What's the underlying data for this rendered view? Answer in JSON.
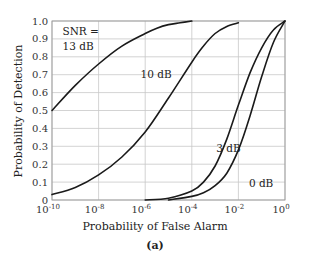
{
  "chart_data": {
    "type": "line",
    "title": "",
    "caption": "(a)",
    "xlabel": "Probability of False Alarm",
    "ylabel": "Probability of Detection",
    "xscale": "log",
    "xlim": [
      1e-10,
      1
    ],
    "ylim": [
      0,
      1.0
    ],
    "grid": true,
    "x_ticks": [
      {
        "base": "10",
        "exp": "-10",
        "log": -10
      },
      {
        "base": "10",
        "exp": "-8",
        "log": -8
      },
      {
        "base": "10",
        "exp": "-6",
        "log": -6
      },
      {
        "base": "10",
        "exp": "-4",
        "log": -4
      },
      {
        "base": "10",
        "exp": "-2",
        "log": -2
      },
      {
        "base": "10",
        "exp": "0",
        "log": 0
      }
    ],
    "y_ticks": [
      "0",
      "0.1",
      "0.2",
      "0.3",
      "0.4",
      "0.5",
      "0.6",
      "0.7",
      "0.8",
      "0.9",
      "1.0"
    ],
    "series": [
      {
        "name": "SNR = 13 dB",
        "label_lines": [
          "SNR =",
          "13 dB"
        ],
        "log_x": [
          -10,
          -9,
          -8,
          -7,
          -6,
          -5.5,
          -5,
          -4.5,
          -4
        ],
        "values": [
          0.5,
          0.64,
          0.76,
          0.86,
          0.93,
          0.96,
          0.98,
          0.99,
          1.0
        ]
      },
      {
        "name": "10 dB",
        "label_lines": [
          "10 dB"
        ],
        "log_x": [
          -10,
          -9,
          -8,
          -7,
          -6,
          -5,
          -4,
          -3.5,
          -3,
          -2.5,
          -2
        ],
        "values": [
          0.03,
          0.07,
          0.14,
          0.24,
          0.38,
          0.57,
          0.77,
          0.86,
          0.93,
          0.97,
          0.99
        ]
      },
      {
        "name": "3 dB",
        "label_lines": [
          "3 dB"
        ],
        "log_x": [
          -6,
          -5,
          -4,
          -3.5,
          -3,
          -2.5,
          -2,
          -1.5,
          -1,
          -0.5,
          0
        ],
        "values": [
          0.0,
          0.01,
          0.05,
          0.1,
          0.19,
          0.34,
          0.53,
          0.71,
          0.85,
          0.95,
          1.0
        ]
      },
      {
        "name": "0 dB",
        "label_lines": [
          "0 dB"
        ],
        "log_x": [
          -5,
          -4,
          -3.5,
          -3,
          -2.5,
          -2,
          -1.5,
          -1,
          -0.5,
          0
        ],
        "values": [
          0.0,
          0.02,
          0.04,
          0.08,
          0.15,
          0.28,
          0.47,
          0.69,
          0.88,
          1.0
        ]
      }
    ],
    "annotations": [
      {
        "text": "SNR =",
        "log_x": -9.55,
        "y": 0.92
      },
      {
        "text": "13 dB",
        "log_x": -9.55,
        "y": 0.84
      },
      {
        "text": "10 dB",
        "log_x": -6.2,
        "y": 0.68
      },
      {
        "text": "3 dB",
        "log_x": -2.95,
        "y": 0.27
      },
      {
        "text": "0 dB",
        "log_x": -1.55,
        "y": 0.07
      }
    ]
  }
}
